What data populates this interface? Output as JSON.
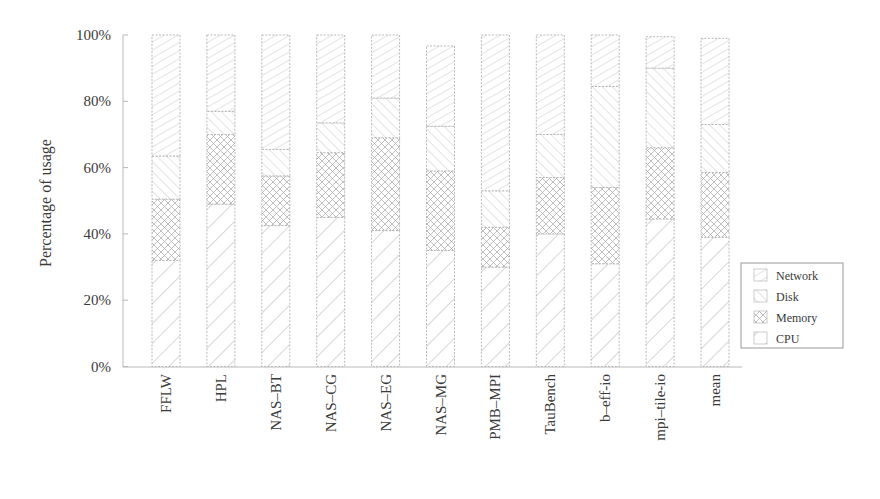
{
  "chart_data": {
    "type": "bar",
    "stacked": true,
    "title": "",
    "xlabel": "",
    "ylabel": "Percentage of usage",
    "ylim": [
      0,
      100
    ],
    "yticks": [
      "0%",
      "20%",
      "40%",
      "60%",
      "80%",
      "100%"
    ],
    "grid": false,
    "legend_position": "right",
    "categories": [
      "FFLW",
      "HPL",
      "NAS-BT",
      "NAS-CG",
      "NAS-EG",
      "NAS-MG",
      "PMB-MPI",
      "TauBench",
      "b-eff-io",
      "mpi-tile-io",
      "mean"
    ],
    "series": [
      {
        "name": "CPU",
        "values": [
          32,
          49,
          42.5,
          45,
          41,
          35,
          30,
          40,
          31,
          44.5,
          39
        ]
      },
      {
        "name": "Memory",
        "values": [
          18.5,
          21,
          15,
          19.5,
          28,
          24,
          12,
          17,
          23,
          21.5,
          19.5
        ]
      },
      {
        "name": "Disk",
        "values": [
          13,
          7,
          8,
          9,
          12,
          13.5,
          11,
          13,
          30.5,
          24,
          14.5
        ]
      },
      {
        "name": "Network",
        "values": [
          36.5,
          23,
          34.5,
          26.5,
          19,
          24.2,
          47,
          30,
          15.5,
          9.5,
          26
        ]
      }
    ]
  },
  "legend": {
    "items": [
      "Network",
      "Disk",
      "Memory",
      "CPU"
    ]
  }
}
